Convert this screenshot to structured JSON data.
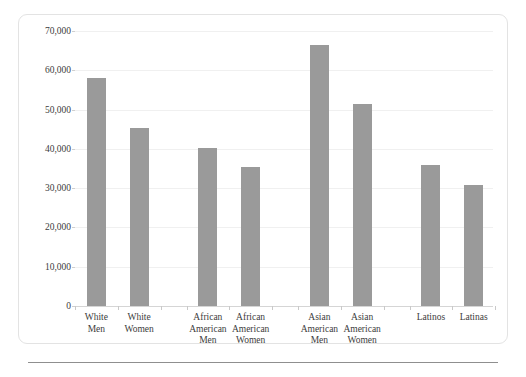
{
  "chart_data": {
    "type": "bar",
    "title": "",
    "xlabel": "",
    "ylabel": "",
    "categories": [
      "White\nMen",
      "White\nWomen",
      "African\nAmerican\nMen",
      "African\nAmerican\nWomen",
      "Asian\nAmerican\nMen",
      "Asian\nAmerican\nWomen",
      "Latinos",
      "Latinas"
    ],
    "values": [
      58000,
      45300,
      40200,
      35400,
      66500,
      51500,
      36000,
      30700
    ],
    "ylim": [
      0,
      70000
    ],
    "ytick_labels": [
      "0",
      "10,000",
      "20,000",
      "30,000",
      "40,000",
      "50,000",
      "60,000",
      "70,000"
    ],
    "ytick_values": [
      0,
      10000,
      20000,
      30000,
      40000,
      50000,
      60000,
      70000
    ],
    "grid": true,
    "legend": "none",
    "bar_color": "#9a9a9a",
    "grid_color": "#f0f0f0",
    "axis_color": "#d5d5d5",
    "group_gaps_after": [
      1,
      3,
      5
    ]
  }
}
